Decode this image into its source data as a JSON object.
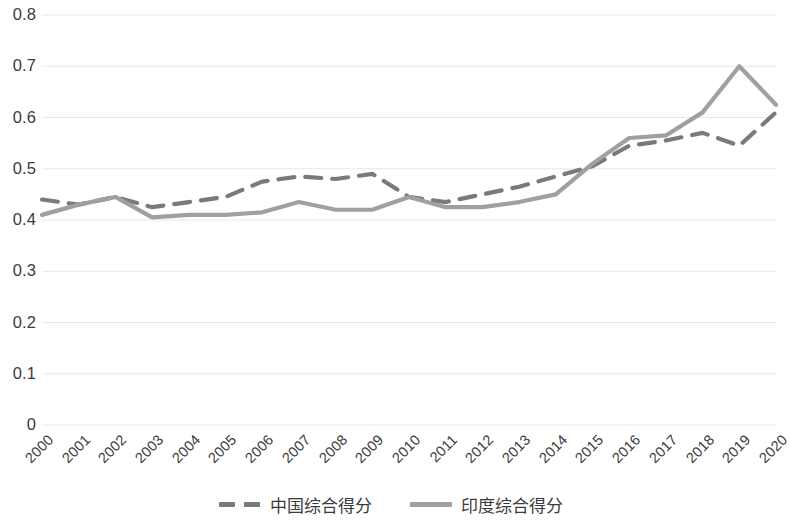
{
  "chart_data": {
    "type": "line",
    "title": "",
    "xlabel": "",
    "ylabel": "",
    "categories": [
      "2000",
      "2001",
      "2002",
      "2003",
      "2004",
      "2005",
      "2006",
      "2007",
      "2008",
      "2009",
      "2010",
      "2011",
      "2012",
      "2013",
      "2014",
      "2015",
      "2016",
      "2017",
      "2018",
      "2019",
      "2020"
    ],
    "ylim": [
      0,
      0.8
    ],
    "ytick_labels": [
      "0.8",
      "0.7",
      "0.6",
      "0.5",
      "0.4",
      "0.3",
      "0.2",
      "0.1",
      "0"
    ],
    "ytick_values": [
      0.8,
      0.7,
      0.6,
      0.5,
      0.4,
      0.3,
      0.2,
      0.1,
      0
    ],
    "grid": true,
    "legend_position": "bottom",
    "series": [
      {
        "name": "中国综合得分",
        "style": "dashed",
        "color": "#7a7a7a",
        "values": [
          0.44,
          0.43,
          0.445,
          0.425,
          0.435,
          0.445,
          0.475,
          0.485,
          0.48,
          0.49,
          0.445,
          0.435,
          0.45,
          0.465,
          0.485,
          0.505,
          0.545,
          0.555,
          0.57,
          0.545,
          0.61
        ]
      },
      {
        "name": "印度综合得分",
        "style": "solid",
        "color": "#a0a0a0",
        "values": [
          0.41,
          0.43,
          0.445,
          0.405,
          0.41,
          0.41,
          0.415,
          0.435,
          0.42,
          0.42,
          0.445,
          0.425,
          0.425,
          0.435,
          0.45,
          0.51,
          0.56,
          0.565,
          0.61,
          0.7,
          0.625
        ]
      }
    ]
  },
  "legend": {
    "items": [
      {
        "label": "中国综合得分",
        "style": "dashed"
      },
      {
        "label": "印度综合得分",
        "style": "solid"
      }
    ]
  },
  "colors": {
    "series_china": "#7a7a7a",
    "series_india": "#a0a0a0",
    "gridline": "#e8e8e8",
    "tick_text": "#3b3b3b",
    "background": "#ffffff"
  }
}
